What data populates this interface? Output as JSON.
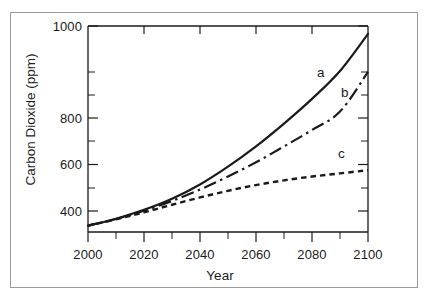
{
  "figure": {
    "name": "co2-projection-chart",
    "background": "#ffffff",
    "border_color": "#9a9a9a",
    "line_color": "#1a1a1a"
  },
  "axis": {
    "x_title": "Year",
    "y_title": "Carbon Dioxide (ppm)",
    "x_ticks": [
      "2000",
      "2020",
      "2040",
      "2060",
      "2080",
      "2100"
    ],
    "y_ticks": [
      "400",
      "600",
      "800",
      "1000"
    ]
  },
  "annotations": {
    "curve_a": "a",
    "curve_b": "b",
    "curve_c": "c"
  },
  "chart_data": {
    "type": "line",
    "title": "",
    "subtitle": "",
    "xlabel": "Year",
    "ylabel": "Carbon Dioxide (ppm)",
    "xlim": [
      2000,
      2100
    ],
    "ylim": [
      350,
      1000
    ],
    "xticks": [
      2000,
      2020,
      2040,
      2060,
      2080,
      2100
    ],
    "xticks_minor": [
      2010,
      2030,
      2050,
      2070,
      2090
    ],
    "yticks": [
      400,
      600,
      800,
      1000
    ],
    "yticks_minor": [
      500,
      700,
      900
    ],
    "grid": false,
    "legend": "inline-curve-labels",
    "x": [
      2000,
      2010,
      2020,
      2030,
      2040,
      2050,
      2060,
      2070,
      2080,
      2090,
      2100
    ],
    "series": [
      {
        "name": "a",
        "label": "a",
        "style": "solid",
        "color": "#1a1a1a",
        "values": [
          370,
          392,
          420,
          455,
          500,
          556,
          620,
          692,
          770,
          858,
          975
        ]
      },
      {
        "name": "b",
        "label": "b",
        "style": "dash-dot",
        "color": "#1a1a1a",
        "values": [
          370,
          391,
          417,
          448,
          484,
          525,
          570,
          620,
          672,
          730,
          855
        ]
      },
      {
        "name": "c",
        "label": "c",
        "style": "dashed",
        "color": "#1a1a1a",
        "values": [
          370,
          390,
          412,
          436,
          459,
          480,
          498,
          513,
          525,
          535,
          545
        ]
      }
    ],
    "annotations": [
      {
        "text": "a",
        "x": 2076,
        "y": 830
      },
      {
        "text": "b",
        "x": 2084,
        "y": 770
      },
      {
        "text": "c",
        "x": 2083,
        "y": 600
      }
    ]
  }
}
